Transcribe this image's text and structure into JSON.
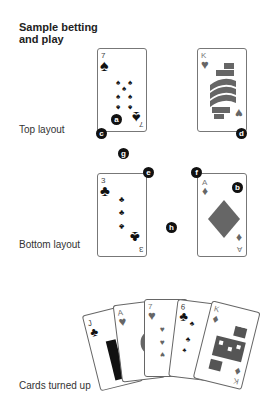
{
  "title": "Sample betting and play",
  "title_line1": "Sample betting",
  "title_line2": "and play",
  "sections": {
    "top": "Top layout",
    "bottom": "Bottom layout",
    "turned": "Cards turned up"
  },
  "cards": {
    "top_left": {
      "rank": "7",
      "suit": "spade",
      "glyph": "♠"
    },
    "top_right": {
      "rank": "K",
      "suit": "heart",
      "glyph": "♥"
    },
    "bottom_left": {
      "rank": "3",
      "suit": "club",
      "glyph": "♣"
    },
    "bottom_right": {
      "rank": "A",
      "suit": "diamond",
      "glyph": "♦"
    }
  },
  "badges": {
    "a": "a",
    "b": "b",
    "c": "c",
    "d": "d",
    "e": "e",
    "f": "f",
    "g": "g",
    "h": "h"
  },
  "fan": [
    {
      "rank": "J",
      "glyph": "♣"
    },
    {
      "rank": "A",
      "glyph": "♥"
    },
    {
      "rank": "7",
      "glyph": "♥"
    },
    {
      "rank": "6",
      "glyph": "♣"
    },
    {
      "rank": "K",
      "glyph": "♦"
    }
  ],
  "colors": {
    "black_suit": "#111111",
    "red_suit_grey": "#666666",
    "badge": "#111111"
  }
}
